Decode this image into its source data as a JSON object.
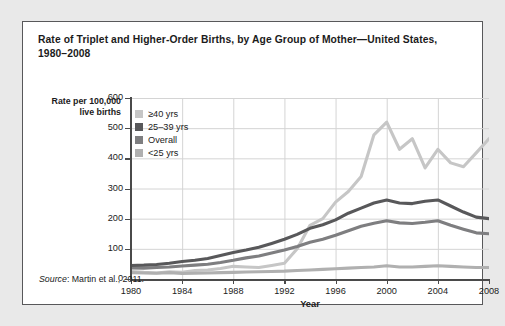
{
  "figure": {
    "title": "Rate of  Triplet and Higher-Order Births, by Age Group of Mother—United States, 1980–2008",
    "source_word": "Source",
    "source_text": ": Martin et al., 2011."
  },
  "legend": {
    "items": [
      {
        "label": "≥40 yrs",
        "color": "#c6c6c6"
      },
      {
        "label": "25–39 yrs",
        "color": "#58585a"
      },
      {
        "label": "Overall",
        "color": "#7e7e80"
      },
      {
        "label": "<25 yrs",
        "color": "#b0b0b0"
      }
    ]
  },
  "chart_data": {
    "type": "line",
    "title": "Rate of  Triplet and Higher-Order Births, by Age Group of Mother—United States, 1980–2008",
    "xlabel": "Year",
    "ylabel": "Rate per 100,000 live births",
    "xlim": [
      1980,
      2008
    ],
    "ylim": [
      0,
      600
    ],
    "xticks": [
      1980,
      1984,
      1988,
      1992,
      1996,
      2000,
      2004,
      2008
    ],
    "yticks": [
      0,
      100,
      200,
      300,
      400,
      500,
      600
    ],
    "grid": true,
    "legend_position": "top-left-inside",
    "x": [
      1980,
      1981,
      1982,
      1983,
      1984,
      1985,
      1986,
      1987,
      1988,
      1989,
      1990,
      1991,
      1992,
      1993,
      1994,
      1995,
      1996,
      1997,
      1998,
      1999,
      2000,
      2001,
      2002,
      2003,
      2004,
      2005,
      2006,
      2007,
      2008
    ],
    "series": [
      {
        "name": "≥40 yrs",
        "color": "#c6c6c6",
        "values": [
          25,
          22,
          20,
          24,
          22,
          28,
          30,
          35,
          42,
          40,
          38,
          45,
          52,
          100,
          178,
          200,
          255,
          290,
          340,
          478,
          520,
          430,
          465,
          368,
          430,
          385,
          372,
          418,
          465
        ]
      },
      {
        "name": "25–39 yrs",
        "color": "#58585a",
        "values": [
          45,
          46,
          48,
          52,
          58,
          62,
          68,
          78,
          88,
          96,
          105,
          118,
          132,
          148,
          168,
          180,
          196,
          218,
          235,
          252,
          262,
          252,
          250,
          258,
          262,
          242,
          222,
          205,
          200
        ]
      },
      {
        "name": "Overall",
        "color": "#7e7e80",
        "values": [
          37,
          36,
          38,
          40,
          43,
          46,
          49,
          55,
          62,
          70,
          76,
          86,
          96,
          108,
          122,
          132,
          145,
          160,
          175,
          185,
          193,
          186,
          184,
          188,
          193,
          178,
          165,
          153,
          150
        ]
      },
      {
        "name": "<25 yrs",
        "color": "#b0b0b0",
        "values": [
          21,
          20,
          19,
          21,
          18,
          19,
          20,
          21,
          22,
          23,
          24,
          25,
          26,
          28,
          30,
          32,
          34,
          36,
          38,
          40,
          44,
          40,
          40,
          42,
          44,
          42,
          40,
          38,
          38
        ]
      }
    ]
  }
}
